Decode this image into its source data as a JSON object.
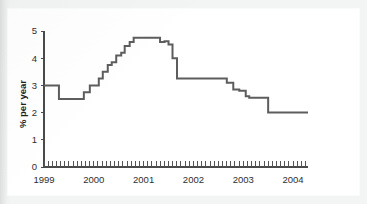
{
  "chart_data": {
    "type": "line",
    "title": "",
    "subtitle": "",
    "xlabel": "",
    "ylabel": "% per year",
    "ylim": [
      0,
      5
    ],
    "xlim": [
      1999.0,
      2004.3
    ],
    "grid": false,
    "legend": null,
    "y_ticks": [
      "0",
      "1",
      "2",
      "3",
      "4",
      "5"
    ],
    "y_tick_values": [
      0,
      1,
      2,
      3,
      4,
      5
    ],
    "x_ticks": [
      "1999",
      "2000",
      "2001",
      "2002",
      "2003",
      "2004"
    ],
    "x_tick_values": [
      1999,
      2000,
      2001,
      2002,
      2003,
      2004
    ],
    "minor_tick_interval_months": 1,
    "line_color": "#5d5d5d",
    "axis_color": "#4a4a4a",
    "background_color": "#ffffff",
    "step_style": "post",
    "series": [
      {
        "name": "policy rate",
        "x": [
          1999.0,
          1999.25,
          1999.3,
          1999.75,
          1999.8,
          1999.92,
          2000.0,
          2000.1,
          2000.18,
          2000.28,
          2000.36,
          2000.45,
          2000.55,
          2000.62,
          2000.72,
          2000.8,
          2001.25,
          2001.33,
          2001.42,
          2001.5,
          2001.58,
          2001.67,
          2002.58,
          2002.67,
          2002.8,
          2002.92,
          2003.05,
          2003.12,
          2003.42,
          2003.5,
          2004.3
        ],
        "values": [
          3.0,
          3.0,
          2.5,
          2.5,
          2.75,
          3.0,
          3.0,
          3.25,
          3.5,
          3.75,
          3.85,
          4.1,
          4.2,
          4.45,
          4.6,
          4.75,
          4.75,
          4.6,
          4.62,
          4.5,
          4.0,
          3.25,
          3.25,
          3.1,
          2.85,
          2.8,
          2.6,
          2.55,
          2.55,
          2.0,
          2.0
        ]
      }
    ],
    "annotations": []
  }
}
